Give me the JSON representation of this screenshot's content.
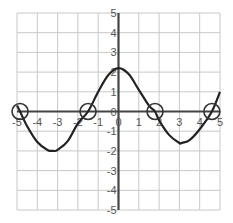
{
  "chart_data": {
    "type": "line",
    "title": "",
    "xlabel": "",
    "ylabel": "",
    "xlim": [
      -5,
      5
    ],
    "ylim": [
      -5,
      5
    ],
    "grid": true,
    "x_ticks": [
      -5,
      -4,
      -3,
      -2,
      -1,
      0,
      1,
      2,
      3,
      4,
      5
    ],
    "y_ticks": [
      5,
      4,
      3,
      2,
      1,
      0,
      -1,
      -2,
      -3,
      -4,
      -5
    ],
    "x_tick_labels": [
      "-5",
      "-4",
      "-3",
      "-2",
      "-1",
      "0",
      "1",
      "2",
      "3",
      "4",
      "5"
    ],
    "y_tick_labels": [
      "5",
      "4",
      "3",
      "2",
      "1",
      "0",
      "-1",
      "-2",
      "-3",
      "-4",
      "-5"
    ],
    "series": [
      {
        "name": "f(x)",
        "x": [
          -5,
          -4.85,
          -4.5,
          -4,
          -3.5,
          -3.2,
          -3,
          -2.5,
          -2,
          -1.5,
          -1,
          -0.5,
          0,
          0.5,
          1,
          1.5,
          1.8,
          2,
          2.5,
          3,
          3.1,
          3.5,
          4,
          4.6,
          5
        ],
        "y": [
          0.3,
          0,
          -0.75,
          -1.55,
          -1.95,
          -2.0,
          -1.95,
          -1.5,
          -0.6,
          0,
          1.0,
          1.85,
          2.2,
          1.9,
          1.1,
          0.3,
          0,
          -0.45,
          -1.2,
          -1.6,
          -1.6,
          -1.45,
          -0.9,
          0,
          1.0
        ]
      }
    ],
    "annotations": [
      {
        "type": "circle",
        "label": "zero",
        "x": -4.85,
        "y": 0
      },
      {
        "type": "circle",
        "label": "zero",
        "x": -1.5,
        "y": 0
      },
      {
        "type": "circle",
        "label": "zero",
        "x": 1.8,
        "y": 0
      },
      {
        "type": "circle",
        "label": "zero",
        "x": 4.6,
        "y": 0
      }
    ],
    "key_points": {
      "maximum": {
        "x": 0,
        "y": 2.2
      },
      "minima": [
        {
          "x": -3.2,
          "y": -2.0
        },
        {
          "x": 3.1,
          "y": -1.6
        }
      ],
      "zeros": [
        -4.85,
        -1.5,
        1.8,
        4.6
      ]
    }
  }
}
